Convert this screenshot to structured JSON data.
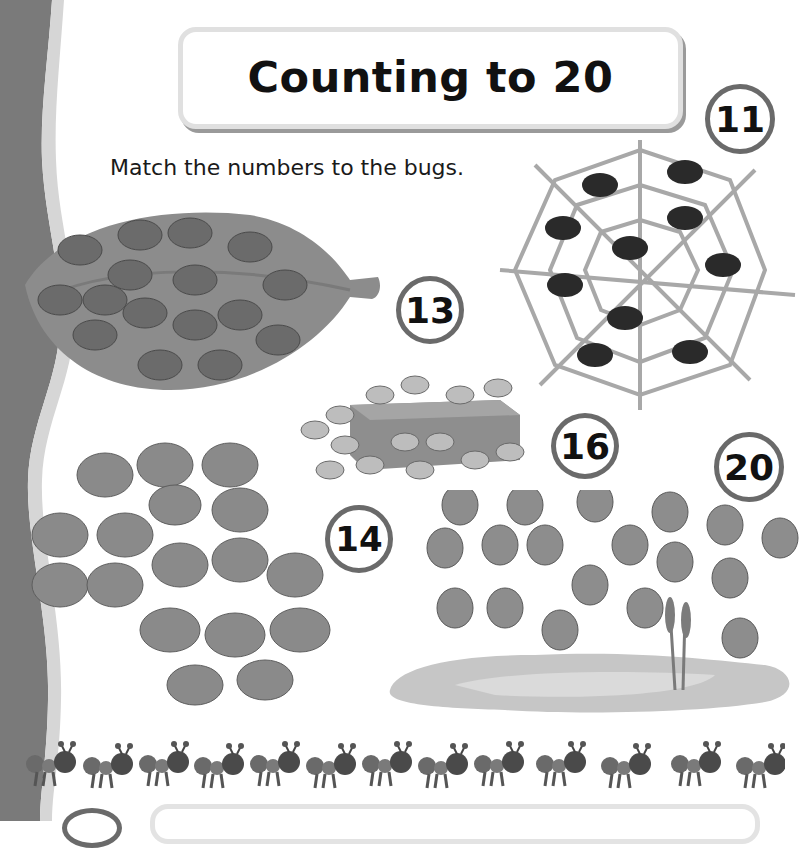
{
  "page": {
    "title": "Counting to 20",
    "instruction": "Match the numbers to the bugs."
  },
  "numbers": [
    {
      "value": "11",
      "label": "number-11"
    },
    {
      "value": "13",
      "label": "number-13"
    },
    {
      "value": "14",
      "label": "number-14"
    },
    {
      "value": "16",
      "label": "number-16"
    },
    {
      "value": "20",
      "label": "number-20"
    }
  ],
  "bug_groups": [
    {
      "kind": "ladybugs",
      "count": 16,
      "scene": "leaf"
    },
    {
      "kind": "spiders",
      "count": 11,
      "scene": "spider web"
    },
    {
      "kind": "crabs",
      "count": 13,
      "scene": "box"
    },
    {
      "kind": "butterflies",
      "count": 20,
      "scene": "open area"
    },
    {
      "kind": "dragonflies",
      "count": 20,
      "scene": "pond"
    },
    {
      "kind": "ants",
      "count": 14,
      "scene": "row"
    }
  ],
  "colors": {
    "side_band": "#7a7a7a",
    "side_band_edge": "#d6d6d6",
    "circle_border": "#6a6a6a",
    "title_border": "#e0e0e0"
  }
}
